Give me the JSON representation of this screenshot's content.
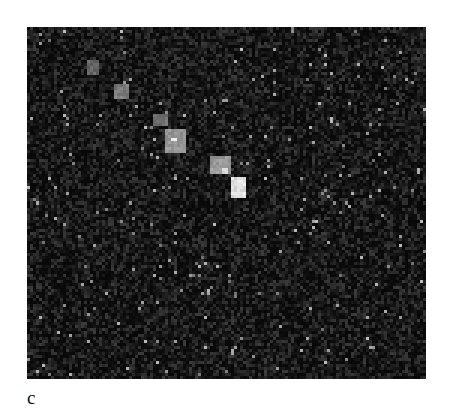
{
  "figure": {
    "panel_label": "c",
    "image": {
      "description": "Dark noisy grayscale microscopy-style image with a diagonal chain of bright clusters",
      "background_color": "#0b0b0b",
      "bright_spots": [
        {
          "x": 60,
          "y": 35,
          "w": 12,
          "h": 14,
          "level": 120
        },
        {
          "x": 88,
          "y": 58,
          "w": 16,
          "h": 14,
          "level": 140
        },
        {
          "x": 128,
          "y": 88,
          "w": 14,
          "h": 12,
          "level": 130
        },
        {
          "x": 138,
          "y": 103,
          "w": 20,
          "h": 24,
          "level": 165
        },
        {
          "x": 146,
          "y": 113,
          "w": 6,
          "h": 4,
          "level": 250
        },
        {
          "x": 183,
          "y": 132,
          "w": 22,
          "h": 18,
          "level": 170
        },
        {
          "x": 197,
          "y": 144,
          "w": 6,
          "h": 6,
          "level": 240
        },
        {
          "x": 204,
          "y": 152,
          "w": 14,
          "h": 20,
          "level": 240
        },
        {
          "x": 214,
          "y": 24,
          "w": 3,
          "h": 3,
          "level": 200
        },
        {
          "x": 304,
          "y": 92,
          "w": 3,
          "h": 3,
          "level": 190
        },
        {
          "x": 392,
          "y": 142,
          "w": 3,
          "h": 5,
          "level": 180
        },
        {
          "x": 67,
          "y": 218,
          "w": 3,
          "h": 4,
          "level": 190
        },
        {
          "x": 173,
          "y": 238,
          "w": 3,
          "h": 4,
          "level": 190
        },
        {
          "x": 252,
          "y": 225,
          "w": 3,
          "h": 4,
          "level": 190
        },
        {
          "x": 334,
          "y": 230,
          "w": 3,
          "h": 4,
          "level": 200
        },
        {
          "x": 180,
          "y": 262,
          "w": 3,
          "h": 6,
          "level": 200
        },
        {
          "x": 284,
          "y": 280,
          "w": 3,
          "h": 4,
          "level": 180
        },
        {
          "x": 205,
          "y": 322,
          "w": 3,
          "h": 6,
          "level": 200
        }
      ]
    }
  }
}
